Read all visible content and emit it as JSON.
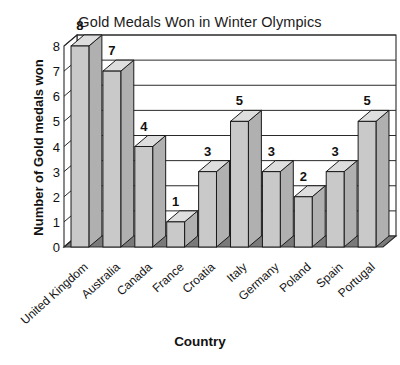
{
  "chart_data": {
    "type": "bar",
    "title": "Gold Medals Won in Winter Olympics",
    "xlabel": "Country",
    "ylabel": "Number of Gold medals won",
    "categories": [
      "United Kingdom",
      "Australia",
      "Canada",
      "France",
      "Croatia",
      "Italy",
      "Germany",
      "Poland",
      "Spain",
      "Portugal"
    ],
    "values": [
      8,
      7,
      4,
      1,
      3,
      5,
      3,
      2,
      3,
      5
    ],
    "value_labels": [
      "8",
      "7",
      "4",
      "1",
      "3",
      "5",
      "3",
      "2",
      "3",
      "5"
    ],
    "ylim": [
      0,
      8
    ],
    "y_ticks": [
      "0",
      "1",
      "2",
      "3",
      "4",
      "5",
      "6",
      "7",
      "8"
    ],
    "grid": true,
    "legend": "none",
    "style": "3d-bar",
    "colors": {
      "bar_face": "#c9c9c9",
      "bar_side": "#b0b0b0",
      "bar_top": "#dedede",
      "bar_outline": "#1a1a1a",
      "floor": "#7a7a7a",
      "grid_line": "#2a2a2a",
      "background": "#ffffff",
      "text": "#111111"
    }
  }
}
